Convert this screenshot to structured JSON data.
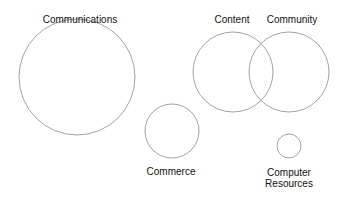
{
  "diagram": {
    "type": "bubble-diagram",
    "stroke_color": "#8a8a8a",
    "nodes": [
      {
        "id": "communications",
        "label": "Communications",
        "cx": 77,
        "cy": 77,
        "r": 58
      },
      {
        "id": "content",
        "label": "Content",
        "cx": 233,
        "cy": 72,
        "r": 40
      },
      {
        "id": "community",
        "label": "Community",
        "cx": 289,
        "cy": 72,
        "r": 40
      },
      {
        "id": "commerce",
        "label": "Commerce",
        "cx": 172,
        "cy": 131,
        "r": 27
      },
      {
        "id": "computer-resources",
        "label_line1": "Computer",
        "label_line2": "Resources",
        "cx": 289,
        "cy": 146,
        "r": 12
      }
    ]
  }
}
